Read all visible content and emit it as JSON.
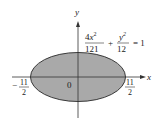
{
  "figure": {
    "axes": {
      "x_label": "x",
      "y_label": "y",
      "origin_label": "0"
    },
    "equation": {
      "term1_num_coef": "4",
      "term1_num_var": "x",
      "term1_num_exp": "2",
      "term1_den": "121",
      "plus": "+",
      "term2_num_var": "y",
      "term2_num_exp": "2",
      "term2_den": "12",
      "equals": "= 1"
    },
    "intercepts": {
      "left": {
        "sign": "−",
        "num": "11",
        "den": "2"
      },
      "right": {
        "num": "11",
        "den": "2"
      }
    },
    "colors": {
      "fill": "#a9a9a9",
      "stroke": "#3a3a3a",
      "axis": "#333333"
    }
  }
}
